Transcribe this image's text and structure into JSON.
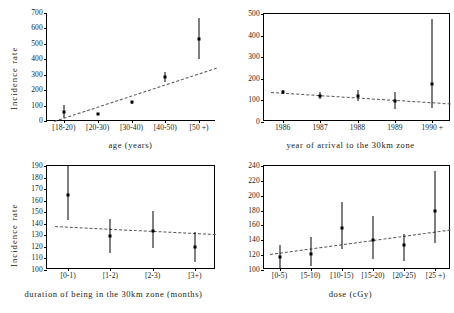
{
  "figure": {
    "panel_count": 4,
    "shared_ylabel": "Incidence rate"
  },
  "chart_data": [
    {
      "id": "age",
      "type": "scatter",
      "title": "",
      "xlabel": "age (years)",
      "ylabel": "Incidence rate",
      "categories": [
        "[18-20)",
        "[20-30)",
        "[30-40)",
        "[40-50)",
        "[50 +)"
      ],
      "values": [
        60,
        45,
        122,
        285,
        530
      ],
      "err_low": [
        20,
        40,
        112,
        255,
        400
      ],
      "err_high": [
        105,
        52,
        132,
        320,
        670
      ],
      "ylim": [
        0,
        700
      ],
      "yticks": [
        0,
        100,
        200,
        300,
        400,
        500,
        600,
        700
      ],
      "grid": false,
      "trend": {
        "y_start": 0,
        "y_end": 345,
        "style": "dashed"
      },
      "legend": "none"
    },
    {
      "id": "year-of-arrival",
      "type": "scatter",
      "title": "",
      "xlabel": "year of arrival to the 30km zone",
      "ylabel": "Incidence rate",
      "categories": [
        "1986",
        "1987",
        "1988",
        "1989",
        "1990 +"
      ],
      "values": [
        140,
        120,
        120,
        97,
        177
      ],
      "err_low": [
        131,
        105,
        97,
        58,
        65
      ],
      "err_high": [
        150,
        138,
        148,
        140,
        478
      ],
      "ylim": [
        0,
        500
      ],
      "yticks": [
        0,
        100,
        200,
        300,
        400,
        500
      ],
      "grid": false,
      "trend": {
        "y_start": 141,
        "y_end": 88,
        "style": "dashed"
      },
      "legend": "none"
    },
    {
      "id": "duration",
      "type": "scatter",
      "title": "",
      "xlabel": "duration of being in the 30km zone (months)",
      "ylabel": "Incidence rate",
      "categories": [
        "[0-1)",
        "[1-2)",
        "[2-3)",
        "[3+)"
      ],
      "values": [
        165,
        129,
        134,
        120
      ],
      "err_low": [
        143,
        115,
        119,
        107
      ],
      "err_high": [
        190,
        144,
        151,
        133
      ],
      "ylim": [
        100,
        190
      ],
      "yticks": [
        100,
        110,
        120,
        130,
        140,
        150,
        160,
        170,
        180,
        190
      ],
      "grid": false,
      "trend": {
        "y_start": 138,
        "y_end": 131,
        "style": "dashed"
      },
      "legend": "none"
    },
    {
      "id": "dose",
      "type": "scatter",
      "title": "",
      "xlabel": "dose (cGy)",
      "ylabel": "Incidence rate",
      "categories": [
        "[0-5)",
        "[5-10)",
        "[10-15)",
        "[15-20)",
        "[20-25)",
        "[25 +)"
      ],
      "values": [
        118,
        122,
        157,
        141,
        133,
        179
      ],
      "err_low": [
        103,
        105,
        128,
        115,
        112,
        137
      ],
      "err_high": [
        134,
        144,
        191,
        173,
        148,
        233
      ],
      "ylim": [
        100,
        240
      ],
      "yticks": [
        100,
        120,
        140,
        160,
        180,
        200,
        220,
        240
      ],
      "grid": false,
      "trend": {
        "y_start": 122,
        "y_end": 155,
        "style": "dashed"
      },
      "legend": "none"
    }
  ]
}
